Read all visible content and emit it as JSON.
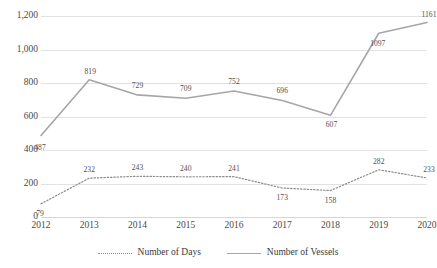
{
  "chart_data": {
    "type": "line",
    "title": "",
    "xlabel": "",
    "ylabel": "",
    "categories": [
      "2012",
      "2013",
      "2014",
      "2015",
      "2016",
      "2017",
      "2018",
      "2019",
      "2020"
    ],
    "ylim": [
      0,
      1200
    ],
    "yticks": [
      0,
      200,
      400,
      600,
      800,
      1000,
      1200
    ],
    "ytick_labels": [
      "0",
      "200",
      "400",
      "600",
      "800",
      "1,000",
      "1,200"
    ],
    "grid": true,
    "legend_position": "bottom",
    "series": [
      {
        "name": "Number of Days",
        "style": "dotted",
        "color": "#8c8c8c",
        "values": [
          79,
          232,
          243,
          240,
          241,
          173,
          158,
          282,
          233
        ]
      },
      {
        "name": "Number of Vessels",
        "style": "solid",
        "color": "#a6a6a6",
        "values": [
          487,
          819,
          729,
          709,
          752,
          696,
          607,
          1097,
          1161
        ]
      }
    ]
  }
}
